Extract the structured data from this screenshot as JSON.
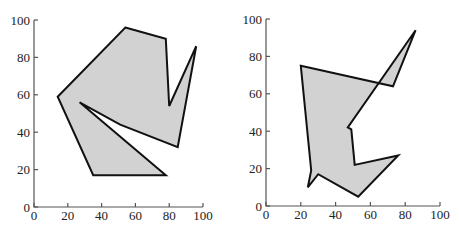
{
  "chart_data": [
    {
      "type": "polygon",
      "title": "",
      "xlabel": "",
      "ylabel": "",
      "xlim": [
        0,
        100
      ],
      "ylim": [
        0,
        100
      ],
      "xticks": [
        "0",
        "20",
        "40",
        "60",
        "80",
        "100"
      ],
      "yticks": [
        "0",
        "20",
        "40",
        "60",
        "80",
        "100"
      ],
      "grid": false,
      "fill_color": "#d2d2d2",
      "stroke_color": "#111111",
      "vertices": [
        [
          54,
          96
        ],
        [
          78,
          90
        ],
        [
          80,
          54
        ],
        [
          96,
          86
        ],
        [
          85,
          32
        ],
        [
          51,
          44
        ],
        [
          27,
          56
        ],
        [
          78,
          17
        ],
        [
          35,
          17
        ],
        [
          14,
          59
        ]
      ]
    },
    {
      "type": "polygon",
      "title": "",
      "xlabel": "",
      "ylabel": "",
      "xlim": [
        0,
        100
      ],
      "ylim": [
        0,
        100
      ],
      "xticks": [
        "0",
        "20",
        "40",
        "60",
        "80",
        "100"
      ],
      "yticks": [
        "0",
        "20",
        "40",
        "60",
        "80",
        "100"
      ],
      "grid": false,
      "fill_color": "#d2d2d2",
      "stroke_color": "#111111",
      "vertices": [
        [
          20,
          75
        ],
        [
          73,
          64
        ],
        [
          86,
          94
        ],
        [
          47,
          42
        ],
        [
          49,
          41
        ],
        [
          51,
          22
        ],
        [
          76,
          27
        ],
        [
          53,
          5
        ],
        [
          30,
          17
        ],
        [
          24,
          10
        ],
        [
          26,
          19
        ]
      ]
    }
  ]
}
